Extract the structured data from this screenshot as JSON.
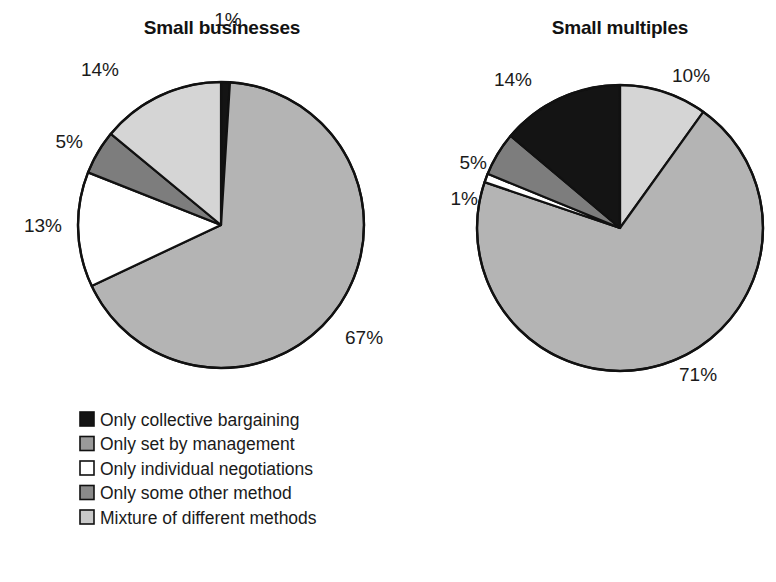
{
  "chart_data": [
    {
      "type": "pie",
      "title": "Small businesses",
      "categories": [
        "Only collective bargaining",
        "Only set by management",
        "Only individual negotiations",
        "Only some other method",
        "Mixture of different methods"
      ],
      "values": [
        1,
        67,
        13,
        5,
        14
      ],
      "labels": [
        "1%",
        "67%",
        "13%",
        "5%",
        "14%"
      ],
      "colors": [
        "#141414",
        "#b4b4b4",
        "#ffffff",
        "#7d7d7d",
        "#d5d5d5"
      ],
      "xlabel": "",
      "ylabel": "",
      "legend_position": "bottom-left",
      "grid": false
    },
    {
      "type": "pie",
      "title": "Small multiples",
      "categories": [
        "Only collective bargaining",
        "Only set by management",
        "Only individual negotiations",
        "Only some other method",
        "Mixture of different methods"
      ],
      "values": [
        14,
        71,
        1,
        5,
        10
      ],
      "labels": [
        "14%",
        "71%",
        "1%",
        "5%",
        "10%"
      ],
      "colors": [
        "#141414",
        "#b4b4b4",
        "#ffffff",
        "#7d7d7d",
        "#d5d5d5"
      ],
      "xlabel": "",
      "ylabel": "",
      "legend_position": "bottom-left",
      "grid": false
    }
  ],
  "charts": {
    "left": {
      "title": "Small businesses",
      "center_x": 221,
      "center_y": 225,
      "radius": 143,
      "start_angle": 0,
      "slices": [
        {
          "key": "collective",
          "label": "1%",
          "value": 1,
          "fill": "#141414",
          "label_x": 228,
          "label_y": 26,
          "anchor": "middle"
        },
        {
          "key": "management",
          "label": "67%",
          "value": 67,
          "fill": "#b4b4b4",
          "label_x": 345,
          "label_y": 344,
          "anchor": "start"
        },
        {
          "key": "individual",
          "label": "13%",
          "value": 13,
          "fill": "#ffffff",
          "label_x": 62,
          "label_y": 232,
          "anchor": "end"
        },
        {
          "key": "other",
          "label": "5%",
          "value": 5,
          "fill": "#7d7d7d",
          "label_x": 83,
          "label_y": 148,
          "anchor": "end"
        },
        {
          "key": "mixture",
          "label": "14%",
          "value": 14,
          "fill": "#d5d5d5",
          "label_x": 119,
          "label_y": 76,
          "anchor": "end"
        }
      ]
    },
    "right": {
      "title": "Small multiples",
      "center_x": 620,
      "center_y": 228,
      "radius": 143,
      "start_angle": 0,
      "slices": [
        {
          "key": "mixture",
          "label": "10%",
          "value": 10,
          "fill": "#d5d5d5",
          "label_x": 672,
          "label_y": 82,
          "anchor": "start"
        },
        {
          "key": "management",
          "label": "71%",
          "value": 71,
          "fill": "#b4b4b4",
          "label_x": 679,
          "label_y": 381,
          "anchor": "start"
        },
        {
          "key": "individual",
          "label": "1%",
          "value": 1,
          "fill": "#ffffff",
          "label_x": 478,
          "label_y": 205,
          "anchor": "end"
        },
        {
          "key": "other",
          "label": "5%",
          "value": 5,
          "fill": "#7d7d7d",
          "label_x": 487,
          "label_y": 169,
          "anchor": "end"
        },
        {
          "key": "collective",
          "label": "14%",
          "value": 14,
          "fill": "#141414",
          "label_x": 532,
          "label_y": 86,
          "anchor": "end"
        }
      ]
    }
  },
  "titles": {
    "left": "Small businesses",
    "right": "Small multiples",
    "left_x": 222,
    "left_y": 34,
    "right_x": 620,
    "right_y": 34
  },
  "legend": {
    "x": 80,
    "y": 412,
    "row_height": 24.5,
    "swatch_size": 14,
    "text_offset": 20,
    "items": [
      {
        "label": "Only collective bargaining",
        "fill": "#141414"
      },
      {
        "label": "Only set by management",
        "fill": "#9a9a9a"
      },
      {
        "label": "Only individual negotiations",
        "fill": "#ffffff"
      },
      {
        "label": "Only some other method",
        "fill": "#8a8a8a"
      },
      {
        "label": "Mixture of different methods",
        "fill": "#c9c9c9"
      }
    ]
  }
}
